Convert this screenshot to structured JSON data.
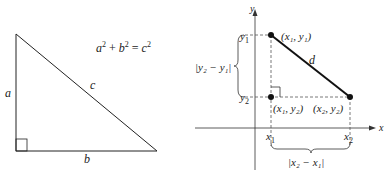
{
  "left_figure": {
    "formula": {
      "a": "a",
      "b": "b",
      "c": "c",
      "exp": "2",
      "plus": "+",
      "eq": "="
    },
    "sides": {
      "vertical": "a",
      "horizontal": "b",
      "hypotenuse": "c"
    }
  },
  "right_figure": {
    "axes": {
      "x": "x",
      "y": "y"
    },
    "ticks": {
      "x1": "x",
      "x1_sub": "1",
      "x2": "x",
      "x2_sub": "2",
      "y1": "y",
      "y1_sub": "1",
      "y2": "y",
      "y2_sub": "2"
    },
    "points": [
      {
        "label": "(x₁, y₁)"
      },
      {
        "label": "(x₁, y₂)"
      },
      {
        "label": "(x₂, y₂)"
      }
    ],
    "distance_label": "d",
    "vertical_diff": "|y₂ − y₁|",
    "horizontal_diff": "|x₂ − x₁|"
  },
  "colors": {
    "line": "#222222",
    "dashed": "#555555"
  }
}
